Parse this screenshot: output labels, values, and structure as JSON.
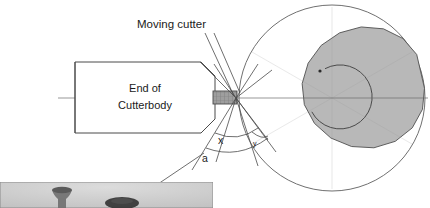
{
  "figure": {
    "type": "technical-diagram",
    "background_color": "#ffffff",
    "line_color": "#3a3a3a"
  },
  "labels": {
    "moving_cutter": "Moving cutter",
    "cutterbody_line1": "End of",
    "cutterbody_line2": "Cutterbody",
    "angle_a": "a",
    "angle_x": "x",
    "angle_y": "y"
  },
  "cutterbody": {
    "fill": "#ffffff",
    "stroke": "#4a4a4a",
    "x": 75,
    "y": 62,
    "width": 140,
    "height": 71,
    "chamfer": 14
  },
  "insert": {
    "name": "cutting-insert",
    "fill": "#9a9a9a",
    "stroke": "#4a4a4a",
    "x": 213,
    "y": 91,
    "width": 24,
    "height": 13
  },
  "tool_tip": {
    "x": 236,
    "y": 98
  },
  "workpiece": {
    "name": "rotating-workpiece",
    "center_x": 332,
    "center_y": 98,
    "radius": 93,
    "facet_count": 14,
    "fill": "#b8b8b8",
    "stroke": "#555555",
    "circle_stroke": "#666666"
  },
  "spiral": {
    "name": "tool-path-spiral",
    "center_x": 340,
    "center_y": 97,
    "radius": 32,
    "gap_start_deg": 118,
    "gap_end_deg": 152,
    "stroke": "#4a4a4a"
  },
  "centerline": {
    "y": 98,
    "x_start": 58,
    "x_end": 428,
    "stroke": "#6a6a6a"
  },
  "inset_photo": {
    "name": "workpiece-photograph",
    "x": 0,
    "y": 182,
    "width": 213,
    "height": 26,
    "background": "#cfcfcf",
    "border": "#8a8a8a",
    "object_color": "#5a5a5a"
  },
  "leaders": [
    {
      "name": "moving-cutter-leader-1",
      "x1": 205,
      "y1": 33,
      "x2": 234,
      "y2": 96
    },
    {
      "name": "moving-cutter-leader-2",
      "x1": 212,
      "y1": 33,
      "x2": 240,
      "y2": 94
    },
    {
      "name": "photo-leader",
      "x1": 160,
      "y1": 182,
      "x2": 205,
      "y2": 152
    }
  ]
}
